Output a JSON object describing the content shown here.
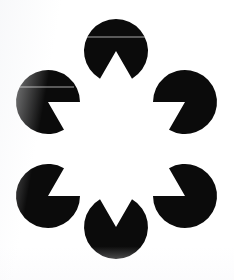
{
  "image": {
    "title": "Kanizsa illusory contour figure",
    "subject": "six-pacman-hexagon-star",
    "width": 234,
    "height": 280,
    "background_color": "#ffffff",
    "shape_color": "#0b0b0b",
    "illusory_shape": "six-pointed-star",
    "disc_count": 6,
    "disc_radius": 32,
    "wedge_angle_degrees": 60,
    "arrangement": "hexagonal-ring",
    "ring_center_x": 116,
    "ring_center_y": 140,
    "ring_radius": 68
  },
  "discs": [
    {
      "name": "top-disc",
      "label": "Top pac-man disc",
      "cx": 116,
      "cy": 51,
      "r": 32,
      "wedge_bisector_degrees": 90,
      "wedge_half_angle_degrees": 30,
      "points_toward": "center-down"
    },
    {
      "name": "upper-right-disc",
      "label": "Upper right pac-man disc",
      "cx": 185,
      "cy": 102,
      "r": 32,
      "wedge_bisector_degrees": 150,
      "wedge_half_angle_degrees": 30,
      "points_toward": "center-down-left"
    },
    {
      "name": "lower-right-disc",
      "label": "Lower right pac-man disc",
      "cx": 185,
      "cy": 196,
      "r": 32,
      "wedge_bisector_degrees": 210,
      "wedge_half_angle_degrees": 30,
      "points_toward": "center-up-left"
    },
    {
      "name": "bottom-disc",
      "label": "Bottom pac-man disc",
      "cx": 116,
      "cy": 227,
      "r": 32,
      "wedge_bisector_degrees": 270,
      "wedge_half_angle_degrees": 30,
      "points_toward": "center-up"
    },
    {
      "name": "lower-left-disc",
      "label": "Lower left pac-man disc",
      "cx": 48,
      "cy": 196,
      "r": 32,
      "wedge_bisector_degrees": 330,
      "wedge_half_angle_degrees": 30,
      "points_toward": "center-up-right"
    },
    {
      "name": "upper-left-disc",
      "label": "Upper left pac-man disc",
      "cx": 48,
      "cy": 102,
      "r": 32,
      "wedge_bisector_degrees": 30,
      "wedge_half_angle_degrees": 30,
      "points_toward": "center-down-right"
    }
  ],
  "artifacts": [
    {
      "name": "scan-line-top-disc",
      "x": 86,
      "y": 36,
      "width": 60,
      "height": 2
    },
    {
      "name": "scan-line-upper-left-disc",
      "x": 20,
      "y": 86,
      "width": 54,
      "height": 2
    }
  ]
}
